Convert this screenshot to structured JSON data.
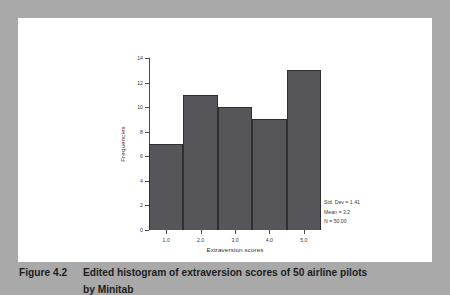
{
  "figure": {
    "caption_number": "Figure 4.2",
    "caption_text": "Edited histogram of extraversion scores of 50 airline pilots",
    "caption_subline": "by Minitab"
  },
  "annotations": {
    "std_dev": "Std. Dev = 1.41",
    "mean": "Mean = 3.2",
    "n": "N = 50.00"
  },
  "colors": {
    "bar_fill": "#55555a",
    "bar_edge": "#2f2f33",
    "panel_background": "#ffffff",
    "page_background": "#a9a9aa",
    "axis": "#4c4c50",
    "text": "#2e2e32"
  },
  "chart_data": {
    "type": "bar",
    "title": "",
    "subtitle": "",
    "xlabel": "Extraversion scores",
    "ylabel": "Frequencies",
    "categories": [
      "1.0",
      "2.0",
      "3.0",
      "4.0",
      "5.0"
    ],
    "x": [
      1.0,
      2.0,
      3.0,
      4.0,
      5.0
    ],
    "values": [
      7,
      11,
      10,
      9,
      13
    ],
    "xlim": [
      0.5,
      5.5
    ],
    "ylim": [
      0,
      14
    ],
    "xticks": [
      "1.0",
      "2.0",
      "3.0",
      "4.0",
      "5.0"
    ],
    "yticks": [
      "0",
      "2",
      "4",
      "6",
      "8",
      "10",
      "12",
      "14"
    ],
    "bar_width": 1.0,
    "grid": false,
    "legend": "none",
    "annotations": [
      "Std. Dev = 1.41",
      "Mean = 3.2",
      "N = 50.00"
    ]
  }
}
